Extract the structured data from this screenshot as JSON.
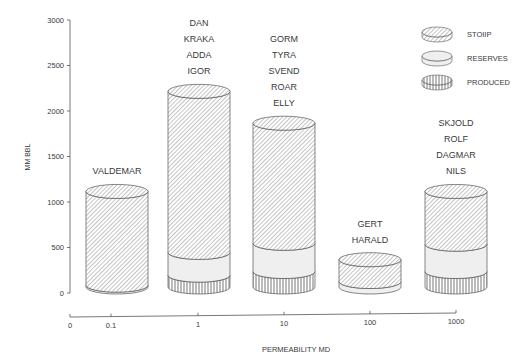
{
  "chart_data": {
    "type": "bar",
    "subtype": "stacked-3d-cylinder",
    "title": "",
    "xlabel": "PERMEABILITY MD",
    "ylabel": "MM BBL",
    "ylim": [
      0,
      3000
    ],
    "yticks": [
      0,
      500,
      1000,
      1500,
      2000,
      2500,
      3000
    ],
    "xscale": "log",
    "xticks": [
      "0",
      "0.1",
      "1",
      "10",
      "100",
      "1000"
    ],
    "grid": false,
    "legend_position": "top-right",
    "legend": [
      {
        "key": "stoiip",
        "label": "STOIIP",
        "pattern": "diagonal-hatch"
      },
      {
        "key": "reserves",
        "label": "RESERVES",
        "pattern": "light-fill"
      },
      {
        "key": "produced",
        "label": "PRODUCED",
        "pattern": "vertical-hatch"
      }
    ],
    "categories": [
      "0.1",
      "1",
      "10",
      "100",
      "1000"
    ],
    "groups": [
      {
        "x": "0.1",
        "fields": [
          "VALDEMAR"
        ],
        "stoiip": 1050,
        "reserves": 20,
        "produced": 0
      },
      {
        "x": "1",
        "fields": [
          "DAN",
          "KRAKA",
          "ADDA",
          "IGOR"
        ],
        "stoiip": 2150,
        "reserves": 250,
        "produced": 130
      },
      {
        "x": "10",
        "fields": [
          "GORM",
          "TYRA",
          "SVEND",
          "ROAR",
          "ELLY"
        ],
        "stoiip": 1800,
        "reserves": 310,
        "produced": 170
      },
      {
        "x": "100",
        "fields": [
          "GERT",
          "HARALD"
        ],
        "stoiip": 300,
        "reserves": 60,
        "produced": 0
      },
      {
        "x": "1000",
        "fields": [
          "SKJOLD",
          "ROLF",
          "DAGMAR",
          "NILS"
        ],
        "stoiip": 1050,
        "reserves": 300,
        "produced": 170
      }
    ],
    "series": [
      {
        "name": "STOIIP",
        "values": [
          1050,
          2150,
          1800,
          300,
          1050
        ]
      },
      {
        "name": "RESERVES",
        "values": [
          20,
          250,
          310,
          60,
          300
        ]
      },
      {
        "name": "PRODUCED",
        "values": [
          0,
          130,
          170,
          0,
          170
        ]
      }
    ]
  },
  "colors": {
    "line": "#555555",
    "hatch": "#8a8a8a",
    "reserves_fill": "#efefef",
    "text": "#3a3a3a"
  }
}
